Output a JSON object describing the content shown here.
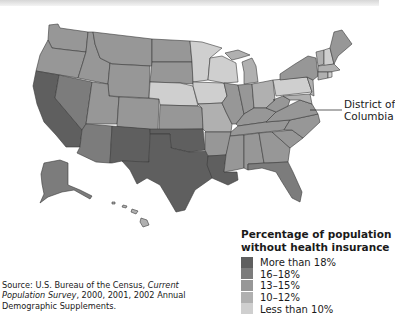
{
  "map": {
    "title": "Percentage of population without health insurance",
    "dc_callout": {
      "line1": "District of",
      "line2": "Columbia"
    },
    "legend": {
      "title_line1": "Percentage of population",
      "title_line2": "without health insurance",
      "items": [
        {
          "label": "More than 18%",
          "color": "#5f5f5f"
        },
        {
          "label": "16–18%",
          "color": "#7c7c7c"
        },
        {
          "label": "13–15%",
          "color": "#979797"
        },
        {
          "label": "10–12%",
          "color": "#b0b0b0"
        },
        {
          "label": "Less than 10%",
          "color": "#cfcfcf"
        }
      ]
    },
    "source": {
      "prefix": "Source: U.S. Bureau of the Census, ",
      "italic": "Current Population Survey",
      "suffix": ", 2000, 2001, 2002 Annual Demographic Supplements."
    },
    "regions": {
      "more_than_18": [
        "California",
        "Arizona-south? no",
        "New Mexico",
        "Texas",
        "Oklahoma",
        "Louisiana"
      ],
      "sixteen_to_18": [
        "Nevada",
        "Arizona",
        "Florida",
        "Alaska",
        "Arkansas",
        "Mississippi"
      ],
      "thirteen_to_15": [
        "Oregon",
        "Washington",
        "Idaho",
        "Montana",
        "Wyoming",
        "Colorado",
        "Utah",
        "Georgia",
        "North Carolina",
        "South Carolina",
        "Alabama",
        "Tennessee",
        "Kentucky",
        "West Virginia",
        "Virginia",
        "New York",
        "Illinois",
        "Indiana",
        "Maine",
        "Kansas"
      ],
      "ten_to_12": [
        "North Dakota",
        "South Dakota",
        "Missouri",
        "Ohio",
        "Michigan",
        "New Jersey",
        "Maryland",
        "Vermont",
        "Massachusetts",
        "Connecticut",
        "Hawaii"
      ],
      "less_than_10": [
        "Minnesota",
        "Iowa",
        "Wisconsin",
        "Nebraska",
        "Pennsylvania",
        "Rhode Island",
        "New Hampshire"
      ]
    }
  }
}
